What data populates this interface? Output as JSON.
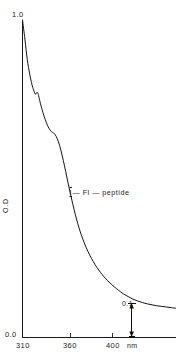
{
  "figure": {
    "background_color": "#ffffff",
    "ink_color": "#1a1a1a",
    "width": 176,
    "height": 359
  },
  "axis": {
    "y_top_label": "1.0",
    "y_bottom_label": "0.0",
    "y_title": "O.D",
    "x_unit": "nm",
    "x_tick_labels": [
      "310",
      "360",
      "400"
    ]
  },
  "annotations": {
    "series_label_prefix": "I",
    "series_label_rest": "— Fl — peptide",
    "series_label_full": "I— Fl — peptide",
    "scalebar_label": "0.1"
  },
  "chart_data": {
    "type": "line",
    "title": "",
    "subtitle": "",
    "xlabel": "nm",
    "ylabel": "O.D",
    "xlim": [
      310,
      438
    ],
    "ylim": [
      0.0,
      1.0
    ],
    "xticks": [
      310,
      360,
      400
    ],
    "xticklabels": [
      "310",
      "360",
      "400"
    ],
    "yticks": [
      0.0,
      1.0
    ],
    "yticklabels": [
      "0.0",
      "1.0"
    ],
    "grid": false,
    "legend": null,
    "legend_position": "none",
    "annotations": [
      {
        "text": "I— Fl — peptide",
        "x": 362,
        "y": 0.46,
        "kind": "series-label"
      },
      {
        "text": "0.1",
        "x": 404,
        "y": 0.05,
        "kind": "scale-bar",
        "bar_x": 401,
        "bar_y_low": 0.0,
        "bar_y_high": 0.107,
        "bar_span": 0.1
      }
    ],
    "series": [
      {
        "name": "I— Fl — peptide",
        "color": "#141414",
        "x": [
          310,
          312,
          314,
          316,
          318,
          320,
          321,
          322,
          323,
          324,
          326,
          328,
          330,
          332,
          334,
          335,
          336,
          338,
          340,
          342,
          344,
          346,
          348,
          350,
          352,
          354,
          356,
          358,
          360,
          363,
          366,
          369,
          372,
          375,
          378,
          381,
          384,
          387,
          390,
          394,
          398,
          402,
          406,
          410,
          414,
          418,
          422,
          426,
          430,
          434,
          438
        ],
        "y": [
          1.0,
          0.94,
          0.875,
          0.83,
          0.795,
          0.772,
          0.766,
          0.772,
          0.768,
          0.752,
          0.722,
          0.697,
          0.676,
          0.659,
          0.649,
          0.646,
          0.644,
          0.634,
          0.616,
          0.59,
          0.558,
          0.523,
          0.487,
          0.452,
          0.419,
          0.388,
          0.36,
          0.335,
          0.313,
          0.284,
          0.26,
          0.239,
          0.221,
          0.205,
          0.191,
          0.179,
          0.168,
          0.158,
          0.149,
          0.138,
          0.129,
          0.121,
          0.115,
          0.11,
          0.106,
          0.103,
          0.1,
          0.098,
          0.096,
          0.094,
          0.092
        ]
      }
    ]
  }
}
